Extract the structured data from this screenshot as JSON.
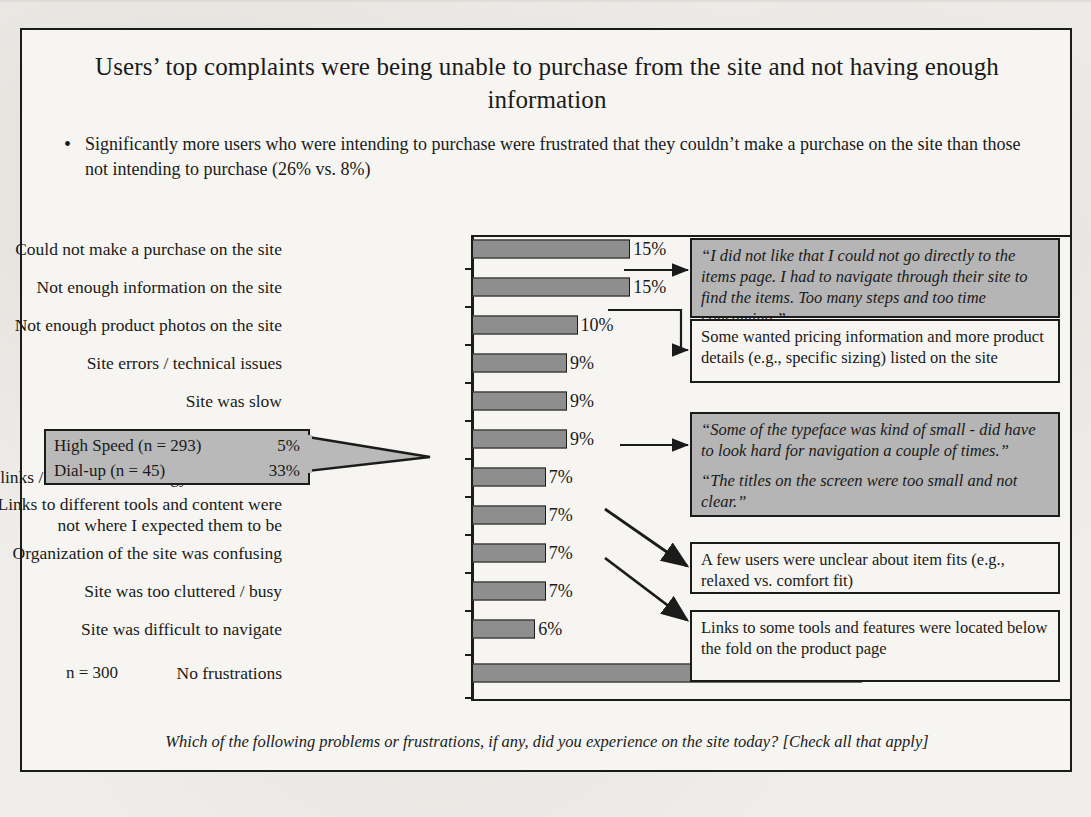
{
  "slide": {
    "title": "Users’ top complaints were being unable to purchase from the site and not having enough information",
    "bullet_marker": "•",
    "bullet": "Significantly more users who were intending to purchase were frustrated that they couldn’t make a purchase on the site than those not intending to purchase (26% vs. 8%)",
    "sample_size_label": "n = 300",
    "question": "Which of the following problems or frustrations, if any, did you experience on the site today? [Check all that apply]",
    "caption": "Figure 11-3. Nine different ways to ask..."
  },
  "speed_callout": {
    "row1_label": "High Speed (n = 293)",
    "row1_value": "5%",
    "row2_label": "Dial-up (n = 45)",
    "row2_value": "33%"
  },
  "callouts": [
    {
      "id": "quote-items-page",
      "style": "quote",
      "lines": [
        "“I did not like that I could not go directly  to the items page. I had to navigate through their site to find the items. Too many steps and too time consuming.”"
      ]
    },
    {
      "id": "pricing-info",
      "style": "plain",
      "lines": [
        "Some wanted pricing information and more product details (e.g., specific sizing) listed on the site"
      ]
    },
    {
      "id": "quote-typeface",
      "style": "quote",
      "lines": [
        "“Some of the typeface was kind of small - did have to look hard for navigation a couple of times.”",
        "“The titles on the screen were too small and not clear.”"
      ]
    },
    {
      "id": "item-fits",
      "style": "plain",
      "lines": [
        "A few users were unclear about item fits (e.g., relaxed vs. comfort fit)"
      ]
    },
    {
      "id": "below-fold",
      "style": "plain",
      "lines": [
        "Links to some tools and features were located below the fold on the product page"
      ]
    }
  ],
  "colors": {
    "bar_fill": "#8e8e8e",
    "quote_box_fill": "#b5b5b5",
    "speed_callout_fill": "#b9b9b9",
    "slide_bg": "#f6f5f1",
    "ink": "#1b1b1b"
  },
  "chart_data": {
    "type": "bar",
    "orientation": "horizontal",
    "title": "Users’ top complaints were being unable to purchase from the site and not having enough information",
    "xlabel": "",
    "ylabel": "",
    "xlim": [
      0,
      40
    ],
    "grid": false,
    "legend": "none",
    "n": 300,
    "value_suffix": "%",
    "categories": [
      "Could not make a purchase on the site",
      "Not enough information on the site",
      "Not enough product photos on the site",
      "Site errors / technical issues",
      "Site was slow",
      "Text / fonts were difficult to read",
      "Some links / labels / terminology were unclear",
      "Links to different tools and content were\nnot where I expected them to be",
      "Organization of the site was confusing",
      "Site was too cluttered / busy",
      "Site was difficult to navigate",
      "No frustrations"
    ],
    "values": [
      15,
      15,
      10,
      9,
      9,
      9,
      7,
      7,
      7,
      7,
      6,
      37
    ],
    "value_labels": [
      "15%",
      "15%",
      "10%",
      "9%",
      "9%",
      "9%",
      "7%",
      "7%",
      "7%",
      "7%",
      "6%",
      "37%"
    ],
    "breakouts": {
      "Site was slow": [
        {
          "segment": "High Speed (n = 293)",
          "value": 5,
          "label": "5%"
        },
        {
          "segment": "Dial-up (n = 45)",
          "value": 33,
          "label": "33%"
        }
      ]
    }
  }
}
